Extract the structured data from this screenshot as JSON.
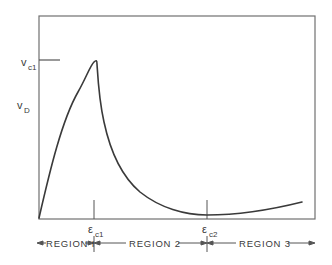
{
  "diagram": {
    "type": "stress-strain-curve",
    "y_axis": {
      "labels": [
        {
          "symbol": "v",
          "subscript": "c1",
          "role": "peak-level-tick"
        },
        {
          "symbol": "v",
          "subscript": "D",
          "role": "axis-label"
        }
      ]
    },
    "x_axis": {
      "ticks": [
        {
          "symbol": "ε",
          "subscript": "c1"
        },
        {
          "symbol": "ε",
          "subscript": "c2"
        }
      ]
    },
    "regions": [
      {
        "label": "REGION 1",
        "display": "REGION I"
      },
      {
        "label": "REGION 2",
        "display": "REGION 2"
      },
      {
        "label": "REGION 3",
        "display": "REGION 3"
      }
    ],
    "colors": {
      "line": "#3a3a3a",
      "frame": "#6a6a6a",
      "background": "#ffffff"
    }
  }
}
